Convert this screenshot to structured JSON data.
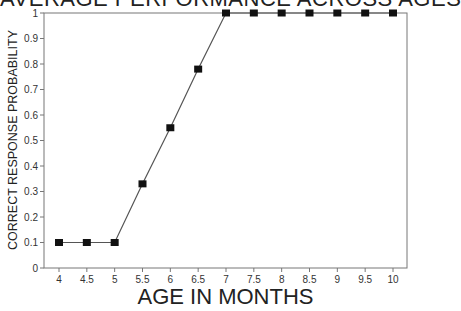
{
  "chart_data": {
    "type": "line",
    "title": "AVERAGE PERFORMANCE ACROSS AGES",
    "xlabel": "AGE IN MONTHS",
    "ylabel": "CORRECT RESPONSE PROBABILITY",
    "x": [
      4,
      4.5,
      5,
      5.5,
      6,
      6.5,
      7,
      7.5,
      8,
      8.5,
      9,
      9.5,
      10
    ],
    "series": [
      {
        "name": "Performance",
        "values": [
          0.1,
          0.1,
          0.1,
          0.33,
          0.55,
          0.78,
          1.0,
          1.0,
          1.0,
          1.0,
          1.0,
          1.0,
          1.0
        ]
      }
    ],
    "xticks": [
      "4",
      "4.5",
      "5",
      "5.5",
      "6",
      "6.5",
      "7",
      "7.5",
      "8",
      "8.5",
      "9",
      "9.5",
      "10"
    ],
    "yticks": [
      "0",
      "0.1",
      "0.2",
      "0.3",
      "0.4",
      "0.5",
      "0.6",
      "0.7",
      "0.8",
      "0.9",
      "1"
    ],
    "ylim": [
      0,
      1
    ],
    "xlim": [
      3.9,
      10.4
    ],
    "grid": false,
    "legend": null,
    "marker": "square",
    "line_color": "#555555",
    "marker_color": "#111111"
  }
}
